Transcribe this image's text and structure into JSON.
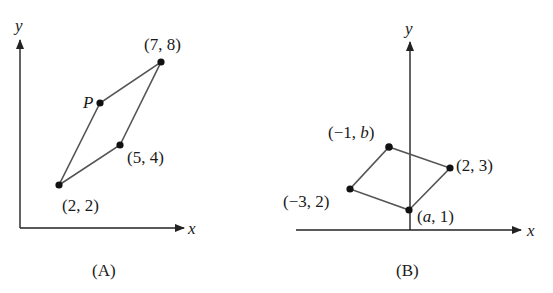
{
  "panels": [
    {
      "id": "A",
      "caption": "(A)",
      "axes": {
        "x_label": "x",
        "y_label": "y"
      },
      "points": [
        {
          "name": "p1",
          "label": "(2, 2)",
          "px": 59,
          "py": 185,
          "lx": 62,
          "ly": 211,
          "anchor": "start"
        },
        {
          "name": "p2",
          "label": "(5, 4)",
          "px": 120,
          "py": 145,
          "lx": 128,
          "ly": 163,
          "anchor": "start"
        },
        {
          "name": "p3",
          "label": "(7, 8)",
          "px": 161,
          "py": 62,
          "lx": 145,
          "ly": 50,
          "anchor": "start"
        },
        {
          "name": "p4",
          "label": "P",
          "px": 100,
          "py": 103,
          "lx": 83,
          "ly": 107,
          "anchor": "start",
          "italic": true
        }
      ]
    },
    {
      "id": "B",
      "caption": "(B)",
      "axes": {
        "x_label": "x",
        "y_label": "y"
      },
      "points": [
        {
          "name": "p1",
          "label": "(a, 1)",
          "px": 409,
          "py": 210,
          "lx": 418,
          "ly": 222,
          "anchor": "start"
        },
        {
          "name": "p2",
          "label": "(2, 3)",
          "px": 450,
          "py": 168,
          "lx": 457,
          "ly": 170,
          "anchor": "start"
        },
        {
          "name": "p3",
          "label": "(−1, b)",
          "px": 389,
          "py": 147,
          "lx": 328,
          "ly": 138,
          "anchor": "start"
        },
        {
          "name": "p4",
          "label": "(−3, 2)",
          "px": 350,
          "py": 189,
          "lx": 283,
          "ly": 207,
          "anchor": "start"
        }
      ]
    }
  ],
  "labels": {
    "A": {
      "x": "x",
      "y": "y",
      "caption": "(A)",
      "P": "P",
      "p22": "(2, 2)",
      "p54": "(5, 4)",
      "p78": "(7, 8)"
    },
    "B": {
      "x": "x",
      "y": "y",
      "caption": "(B)",
      "pa1": ", 1)",
      "pa1_a": "a",
      "pa1_open": "(",
      "p23": "(2, 3)",
      "pm1b_pre": "(−1, ",
      "pm1b_b": "b",
      "pm1b_post": ")",
      "pm32": "(−3, 2)"
    }
  },
  "colors": {
    "axis": "#222222",
    "edge": "#555555",
    "dot": "#111111",
    "text": "#1a1a1a"
  }
}
